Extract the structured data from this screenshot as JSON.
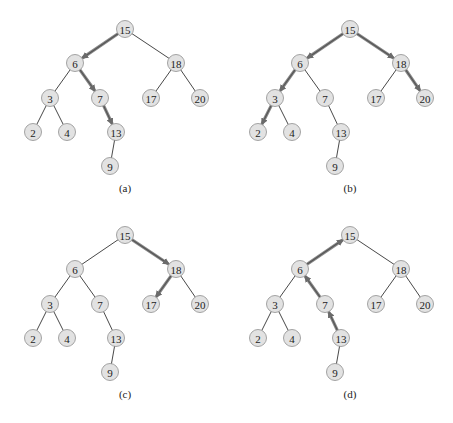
{
  "figure": {
    "colors": {
      "node_fill": "#e2e2e2",
      "node_stroke": "#9a9a9a",
      "edge": "#333333",
      "highlight": "#8a8a8a"
    },
    "tree": {
      "nodes": [
        {
          "id": "15",
          "x": 125,
          "y": 29
        },
        {
          "id": "6",
          "x": 75,
          "y": 63
        },
        {
          "id": "18",
          "x": 176,
          "y": 63
        },
        {
          "id": "3",
          "x": 50,
          "y": 98
        },
        {
          "id": "7",
          "x": 100,
          "y": 98
        },
        {
          "id": "17",
          "x": 151,
          "y": 98
        },
        {
          "id": "20",
          "x": 200,
          "y": 98
        },
        {
          "id": "2",
          "x": 33,
          "y": 132
        },
        {
          "id": "4",
          "x": 67,
          "y": 132
        },
        {
          "id": "13",
          "x": 116,
          "y": 132
        },
        {
          "id": "9",
          "x": 110,
          "y": 166
        }
      ],
      "edges": [
        [
          "15",
          "6"
        ],
        [
          "15",
          "18"
        ],
        [
          "6",
          "3"
        ],
        [
          "6",
          "7"
        ],
        [
          "18",
          "17"
        ],
        [
          "18",
          "20"
        ],
        [
          "3",
          "2"
        ],
        [
          "3",
          "4"
        ],
        [
          "7",
          "13"
        ],
        [
          "13",
          "9"
        ]
      ]
    },
    "panels": [
      {
        "label": "(a)",
        "dx": 0,
        "dy": 0,
        "arrows": [
          [
            "15",
            "6"
          ],
          [
            "6",
            "7"
          ],
          [
            "7",
            "13"
          ]
        ]
      },
      {
        "label": "(b)",
        "dx": 225,
        "dy": 0,
        "arrows": [
          [
            "15",
            "6"
          ],
          [
            "6",
            "3"
          ],
          [
            "3",
            "2"
          ],
          [
            "15",
            "18"
          ],
          [
            "18",
            "20"
          ]
        ]
      },
      {
        "label": "(c)",
        "dx": 0,
        "dy": 206,
        "arrows": [
          [
            "15",
            "18"
          ],
          [
            "18",
            "17"
          ]
        ]
      },
      {
        "label": "(d)",
        "dx": 225,
        "dy": 206,
        "arrows": [
          [
            "13",
            "7"
          ],
          [
            "7",
            "6"
          ],
          [
            "6",
            "15"
          ]
        ]
      }
    ],
    "caption_y": 192
  }
}
